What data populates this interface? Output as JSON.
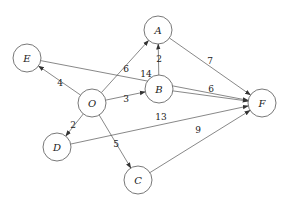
{
  "graph": {
    "type": "directed-weighted",
    "node_color": "#ffffff",
    "stroke_color": "#555555",
    "nodes": [
      {
        "id": "E",
        "label": "E",
        "x": 27,
        "y": 58
      },
      {
        "id": "A",
        "label": "A",
        "x": 158,
        "y": 30
      },
      {
        "id": "O",
        "label": "O",
        "x": 92,
        "y": 103
      },
      {
        "id": "B",
        "label": "B",
        "x": 159,
        "y": 89
      },
      {
        "id": "F",
        "label": "F",
        "x": 262,
        "y": 103
      },
      {
        "id": "D",
        "label": "D",
        "x": 57,
        "y": 147
      },
      {
        "id": "C",
        "label": "C",
        "x": 138,
        "y": 180
      }
    ],
    "edges": [
      {
        "from": "O",
        "to": "E",
        "weight": "4",
        "lx": 60,
        "ly": 83
      },
      {
        "from": "O",
        "to": "A",
        "weight": "6",
        "lx": 126,
        "ly": 69
      },
      {
        "from": "E",
        "to": "F",
        "weight": "14",
        "lx": 146,
        "ly": 74
      },
      {
        "from": "B",
        "to": "A",
        "weight": "2",
        "lx": 159,
        "ly": 59
      },
      {
        "from": "O",
        "to": "B",
        "weight": "3",
        "lx": 126,
        "ly": 99
      },
      {
        "from": "A",
        "to": "F",
        "weight": "7",
        "lx": 210,
        "ly": 61
      },
      {
        "from": "B",
        "to": "F",
        "weight": "6",
        "lx": 211,
        "ly": 89
      },
      {
        "from": "O",
        "to": "D",
        "weight": "2",
        "lx": 73,
        "ly": 125
      },
      {
        "from": "D",
        "to": "F",
        "weight": "13",
        "lx": 161,
        "ly": 117
      },
      {
        "from": "O",
        "to": "C",
        "weight": "5",
        "lx": 116,
        "ly": 144
      },
      {
        "from": "C",
        "to": "F",
        "weight": "9",
        "lx": 198,
        "ly": 130
      }
    ]
  }
}
